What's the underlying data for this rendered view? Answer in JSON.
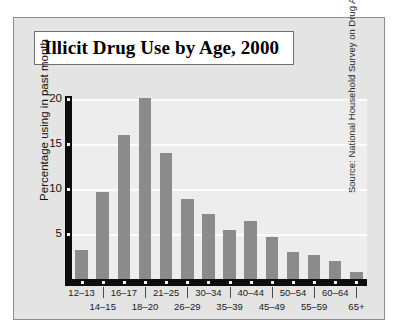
{
  "chart_data": {
    "type": "bar",
    "title": "Illicit Drug Use by Age, 2000",
    "xlabel": "",
    "ylabel": "Percentage using in past month",
    "categories": [
      "12–13",
      "14–15",
      "16–17",
      "18–20",
      "21–25",
      "26–29",
      "30–34",
      "35–39",
      "40–44",
      "45–49",
      "50–54",
      "55–59",
      "60–64",
      "65+"
    ],
    "values": [
      3.2,
      9.7,
      16.0,
      20.1,
      14.0,
      8.9,
      7.2,
      5.5,
      6.4,
      4.7,
      3.0,
      2.7,
      2.0,
      0.8
    ],
    "ylim": [
      0,
      20
    ],
    "yticks": [
      5,
      10,
      15,
      20
    ],
    "ytick_labels": [
      "5",
      "10",
      "15",
      "20"
    ],
    "grid": true,
    "legend": false,
    "annotation": "Source: National Household Survey on Drug Abuse, 2000.",
    "bar_color": "#8b8b8b",
    "plot_background": "#ededed",
    "panel_background": "#e4e4e4",
    "axis_color": "#0d0d0d"
  },
  "figure": {
    "title_box_label": "Illicit Drug Use by Age, 2000",
    "source_label": "Source: National Household Survey on Drug Abuse, 2000."
  }
}
